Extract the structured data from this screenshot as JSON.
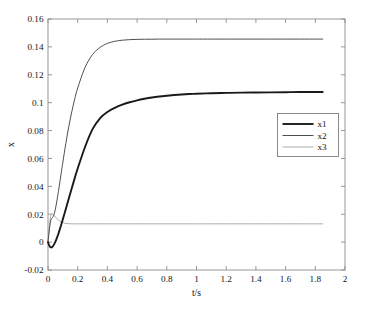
{
  "chart_data": {
    "type": "line",
    "title": "",
    "xlabel": "t/s",
    "ylabel": "x",
    "xlim": [
      0,
      2
    ],
    "ylim": [
      -0.02,
      0.16
    ],
    "grid": false,
    "legend_position": "upper-right-center",
    "xticks": [
      "0",
      "0.2",
      "0.4",
      "0.6",
      "0.8",
      "1",
      "1.2",
      "1.4",
      "1.6",
      "1.8",
      "2"
    ],
    "xtick_values": [
      0,
      0.2,
      0.4,
      0.6,
      0.8,
      1,
      1.2,
      1.4,
      1.6,
      1.8,
      2
    ],
    "yticks": [
      "-0.02",
      "0",
      "0.02",
      "0.04",
      "0.06",
      "0.08",
      "0.1",
      "0.12",
      "0.14",
      "0.16"
    ],
    "ytick_values": [
      -0.02,
      0,
      0.02,
      0.04,
      0.06,
      0.08,
      0.1,
      0.12,
      0.14,
      0.16
    ],
    "x": [
      0,
      0.01,
      0.02,
      0.03,
      0.04,
      0.05,
      0.06,
      0.07,
      0.08,
      0.09,
      0.1,
      0.12,
      0.14,
      0.16,
      0.18,
      0.2,
      0.25,
      0.3,
      0.35,
      0.4,
      0.45,
      0.5,
      0.55,
      0.6,
      0.65,
      0.7,
      0.75,
      0.8,
      0.85,
      0.9,
      0.95,
      1.0,
      1.1,
      1.2,
      1.3,
      1.4,
      1.5,
      1.6,
      1.7,
      1.8,
      1.85
    ],
    "series": [
      {
        "name": "x1",
        "color": "#1a1a1a",
        "width": 1.9,
        "steady_state": 0.107,
        "values": [
          0,
          -0.0028,
          -0.0038,
          -0.0033,
          -0.0018,
          0.0003,
          0.003,
          0.006,
          0.0093,
          0.0128,
          0.0164,
          0.0238,
          0.0313,
          0.0387,
          0.0459,
          0.0528,
          0.0684,
          0.081,
          0.0888,
          0.0933,
          0.0963,
          0.0986,
          0.1003,
          0.1017,
          0.1028,
          0.1037,
          0.1044,
          0.105,
          0.1055,
          0.1059,
          0.1062,
          0.1064,
          0.1068,
          0.107,
          0.1072,
          0.1073,
          0.1074,
          0.1075,
          0.1076,
          0.1076,
          0.1077
        ]
      },
      {
        "name": "x2",
        "color": "#4f4f4f",
        "width": 1.0,
        "steady_state": 0.145,
        "values": [
          0,
          0.0098,
          0.0162,
          0.0175,
          0.0196,
          0.0238,
          0.0296,
          0.0362,
          0.0432,
          0.0503,
          0.0573,
          0.0707,
          0.0828,
          0.0934,
          0.1026,
          0.1105,
          0.1254,
          0.1345,
          0.1396,
          0.1425,
          0.144,
          0.1448,
          0.1452,
          0.1454,
          0.1455,
          0.1455,
          0.1456,
          0.1456,
          0.1456,
          0.1456,
          0.1456,
          0.1456,
          0.1456,
          0.1456,
          0.1456,
          0.1456,
          0.1456,
          0.1456,
          0.1456,
          0.1456,
          0.1456
        ]
      },
      {
        "name": "x3",
        "color": "#a3a3a3",
        "width": 0.9,
        "steady_state": 0.0131,
        "values": [
          0,
          0.012,
          0.0196,
          0.0202,
          0.0193,
          0.018,
          0.0168,
          0.0158,
          0.015,
          0.0144,
          0.014,
          0.0134,
          0.0132,
          0.0131,
          0.0131,
          0.0131,
          0.0131,
          0.0131,
          0.0131,
          0.0131,
          0.0131,
          0.0131,
          0.0131,
          0.0131,
          0.0131,
          0.0131,
          0.0131,
          0.0131,
          0.0131,
          0.0131,
          0.0131,
          0.0131,
          0.0131,
          0.0131,
          0.0131,
          0.0131,
          0.0131,
          0.0131,
          0.0131,
          0.0131,
          0.0131
        ]
      }
    ],
    "legend_entries": [
      {
        "label": "x1",
        "color": "#1a1a1a",
        "width": 1.9
      },
      {
        "label": "x2",
        "color": "#4f4f4f",
        "width": 1.0
      },
      {
        "label": "x3",
        "color": "#a3a3a3",
        "width": 0.9
      }
    ]
  },
  "axes": {
    "plot_left": 48,
    "plot_top": 19,
    "plot_right": 345,
    "plot_bottom": 270
  }
}
